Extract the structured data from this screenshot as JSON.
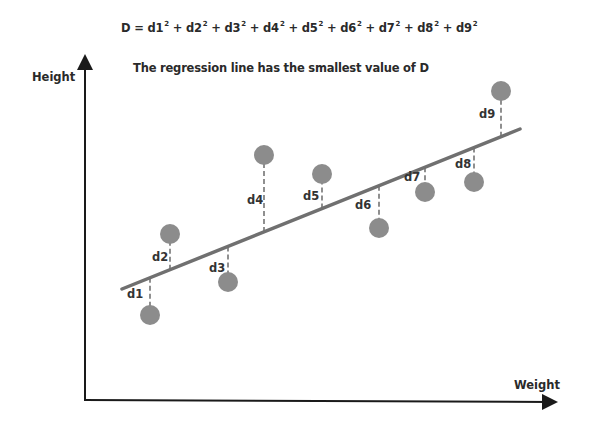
{
  "formula": {
    "prefix": "D = ",
    "terms": [
      "d1",
      "d2",
      "d3",
      "d4",
      "d5",
      "d6",
      "d7",
      "d8",
      "d9"
    ],
    "exponent": "2",
    "joiner": " + "
  },
  "subtitle": "The regression line has the smallest value of D",
  "axes": {
    "y_label": "Height",
    "x_label": "Weight"
  },
  "colors": {
    "point": "#8c8c8c",
    "line": "#707070",
    "axis": "#1a1a1a",
    "residual": "#555555"
  },
  "chart_data": {
    "type": "scatter",
    "subtitle": "The regression line has the smallest value of D",
    "xlabel": "Weight",
    "ylabel": "Height",
    "grid": false,
    "regression_line": {
      "x1": 122,
      "y1": 289,
      "x2": 520,
      "y2": 129
    },
    "points": [
      {
        "label": "d1",
        "cx": 150,
        "cy": 315,
        "label_x": 127,
        "label_y": 287
      },
      {
        "label": "d2",
        "cx": 170,
        "cy": 234,
        "label_x": 152,
        "label_y": 250
      },
      {
        "label": "d3",
        "cx": 228,
        "cy": 282,
        "label_x": 209,
        "label_y": 261
      },
      {
        "label": "d4",
        "cx": 264,
        "cy": 155,
        "label_x": 247,
        "label_y": 193
      },
      {
        "label": "d5",
        "cx": 322,
        "cy": 174,
        "label_x": 303,
        "label_y": 189
      },
      {
        "label": "d6",
        "cx": 379,
        "cy": 228,
        "label_x": 355,
        "label_y": 198
      },
      {
        "label": "d7",
        "cx": 425,
        "cy": 192,
        "label_x": 404,
        "label_y": 170
      },
      {
        "label": "d8",
        "cx": 474,
        "cy": 182,
        "label_x": 455,
        "label_y": 157
      },
      {
        "label": "d9",
        "cx": 501,
        "cy": 91,
        "label_x": 479,
        "label_y": 107
      }
    ]
  }
}
